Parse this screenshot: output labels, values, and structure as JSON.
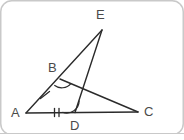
{
  "figure": {
    "type": "geometry-diagram",
    "background_color": "#ffffff",
    "stroke_color": "#2b2b2b",
    "label_color": "#4a4a4a",
    "border_color": "#c8c8c8",
    "points": {
      "A": {
        "x": 26,
        "y": 113,
        "label": "A",
        "label_x": 11,
        "label_y": 106
      },
      "B": {
        "x": 60,
        "y": 79,
        "label": "B",
        "label_x": 48,
        "label_y": 61
      },
      "C": {
        "x": 138,
        "y": 112,
        "label": "C",
        "label_x": 144,
        "label_y": 105
      },
      "D": {
        "x": 75,
        "y": 112,
        "label": "D",
        "label_x": 70,
        "label_y": 120
      },
      "E": {
        "x": 102,
        "y": 30,
        "label": "E",
        "label_x": 96,
        "label_y": 8
      }
    },
    "segments": [
      {
        "name": "segment-AC",
        "from": "A",
        "to": "C"
      },
      {
        "name": "segment-AE",
        "from": "A",
        "to": "E"
      },
      {
        "name": "segment-DE",
        "from": "D",
        "to": "E"
      },
      {
        "name": "segment-BC",
        "from": "B",
        "to": "C"
      }
    ],
    "tick_marks": [
      {
        "name": "tick-segment-AB",
        "segment": "AB",
        "count": 1,
        "x": 45,
        "y": 95
      },
      {
        "name": "tick-segment-AD",
        "segment": "AD",
        "count": 2,
        "x": 57,
        "y": 112
      }
    ],
    "angle_arcs": [
      {
        "name": "angle-arc-B",
        "vertex": "B",
        "radius": 13
      },
      {
        "name": "angle-arc-D",
        "vertex": "D",
        "radius": 13
      }
    ]
  }
}
